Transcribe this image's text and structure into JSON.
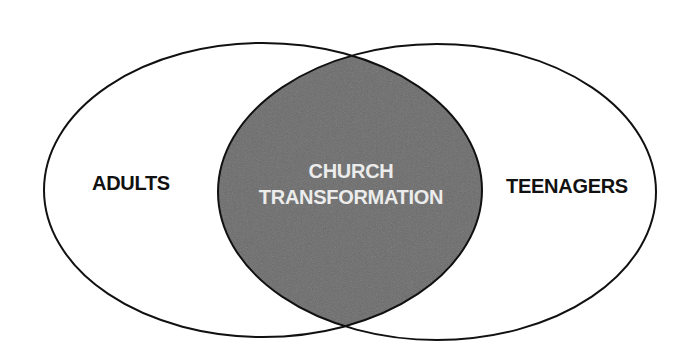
{
  "diagram": {
    "type": "venn",
    "sets": [
      {
        "id": "left",
        "label": "ADULTS"
      },
      {
        "id": "right",
        "label": "TEENAGERS"
      }
    ],
    "intersection": {
      "line1": "CHURCH",
      "line2": "TRANSFORMATION"
    },
    "colors": {
      "stroke": "#111111",
      "intersection_fill": "#6b6b6b",
      "outer_label": "#111111",
      "inner_label": "#ececec",
      "background": "#ffffff"
    }
  }
}
